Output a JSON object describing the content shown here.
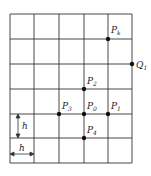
{
  "diagram": {
    "grid": {
      "x_lines": [
        10,
        34,
        59,
        84,
        108,
        132
      ],
      "y_lines": [
        14,
        39,
        64,
        89,
        114,
        138,
        163
      ],
      "color": "#333333"
    },
    "points": [
      {
        "id": "Pk",
        "label": "P",
        "sub": "k",
        "x": 108,
        "y": 39,
        "lx": 111,
        "ly": 33
      },
      {
        "id": "Q1",
        "label": "Q",
        "sub": "1",
        "x": 132,
        "y": 64,
        "lx": 136,
        "ly": 68
      },
      {
        "id": "P2",
        "label": "P",
        "sub": "2",
        "x": 84,
        "y": 89,
        "lx": 87,
        "ly": 84
      },
      {
        "id": "P3",
        "label": "P",
        "sub": "3",
        "x": 59,
        "y": 114,
        "lx": 62,
        "ly": 109
      },
      {
        "id": "P0",
        "label": "P",
        "sub": "0",
        "x": 84,
        "y": 114,
        "lx": 87,
        "ly": 109
      },
      {
        "id": "P1",
        "label": "P",
        "sub": "1",
        "x": 108,
        "y": 114,
        "lx": 111,
        "ly": 109
      },
      {
        "id": "P4",
        "label": "P",
        "sub": "4",
        "x": 84,
        "y": 138,
        "lx": 87,
        "ly": 133
      }
    ],
    "dimensions": {
      "vertical_h": {
        "label": "h",
        "x": 18,
        "y1": 114,
        "y2": 138
      },
      "horizontal_h": {
        "label": "h",
        "y": 154,
        "x1": 10,
        "x2": 34
      }
    }
  }
}
